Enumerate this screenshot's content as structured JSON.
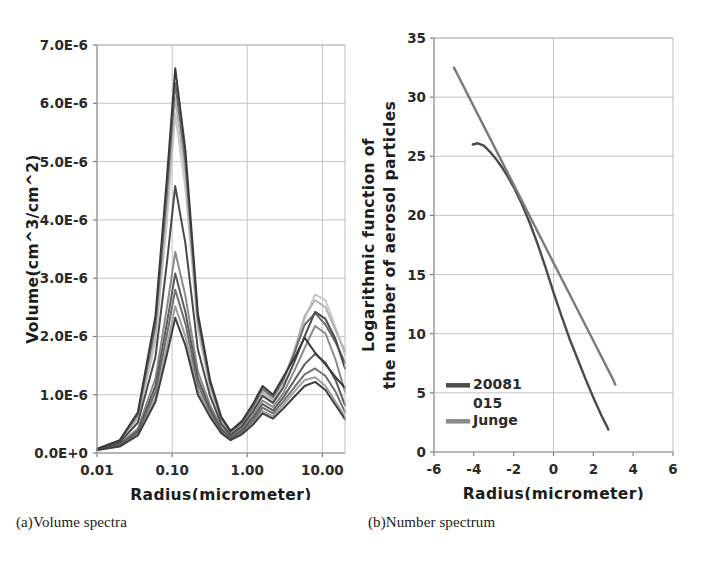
{
  "figure": {
    "caption_a": "(a)Volume spectra",
    "caption_b": "(b)Number spectrum"
  },
  "chart_data": [
    {
      "panel": "a",
      "type": "line",
      "title": "",
      "xlabel": "Radius(micrometer)",
      "ylabel": "Volume(cm^3/cm^2)",
      "xscale": "log",
      "xlim": [
        0.01,
        20
      ],
      "ylim": [
        0.0,
        7e-06
      ],
      "grid": true,
      "legend_position": "none",
      "xticks": [
        0.01,
        0.1,
        1.0,
        10.0
      ],
      "xticklabels": [
        "0.01",
        "0.10",
        "1.00",
        "10.00"
      ],
      "yticks": [
        0.0,
        1e-06,
        2e-06,
        3e-06,
        4e-06,
        5e-06,
        6e-06,
        7e-06
      ],
      "yticklabels": [
        "0.0E+0",
        "1.0E-6",
        "2.0E-6",
        "3.0E-6",
        "4.0E-6",
        "5.0E-6",
        "6.0E-6",
        "7.0E-6"
      ],
      "x": [
        0.01,
        0.02,
        0.035,
        0.06,
        0.085,
        0.11,
        0.15,
        0.22,
        0.32,
        0.45,
        0.6,
        0.85,
        1.2,
        1.6,
        2.2,
        3.0,
        4.2,
        5.8,
        8.0,
        11.0,
        15.0,
        20.0
      ],
      "series": [
        {
          "name": "curve-1",
          "color": "#3a3a3a",
          "values": [
            7e-08,
            2.2e-07,
            7e-07,
            2.35e-06,
            4.7e-06,
            6.6e-06,
            5.2e-06,
            2.4e-06,
            1.25e-06,
            6.2e-07,
            3.8e-07,
            5.5e-07,
            8.5e-07,
            1.15e-06,
            1e-06,
            1.3e-06,
            1.62e-06,
            1.98e-06,
            1.72e-06,
            1.52e-06,
            1.3e-06,
            1.12e-06
          ]
        },
        {
          "name": "curve-2",
          "color": "#6a6a6a",
          "values": [
            7e-08,
            2.1e-07,
            6.6e-07,
            2.2e-06,
            4.45e-06,
            6.35e-06,
            5e-06,
            2.3e-06,
            1.2e-06,
            6e-07,
            3.6e-07,
            5.2e-07,
            8e-07,
            1.1e-06,
            9.6e-07,
            1.25e-06,
            1.7e-06,
            2.2e-06,
            2.4e-06,
            2.2e-06,
            1.9e-06,
            1.55e-06
          ]
        },
        {
          "name": "curve-3",
          "color": "#b4b4b4",
          "values": [
            7e-08,
            2e-07,
            6.2e-07,
            2.05e-06,
            4.2e-06,
            6.1e-06,
            4.8e-06,
            2.22e-06,
            1.16e-06,
            5.7e-07,
            3.4e-07,
            5e-07,
            7.8e-07,
            1.05e-06,
            9.2e-07,
            1.22e-06,
            1.75e-06,
            2.35e-06,
            2.62e-06,
            2.5e-06,
            2.1e-06,
            1.75e-06
          ]
        },
        {
          "name": "curve-4",
          "color": "#4a4a4a",
          "values": [
            6e-08,
            1.8e-07,
            5.2e-07,
            1.65e-06,
            3.25e-06,
            4.58e-06,
            3.6e-06,
            1.78e-06,
            9.8e-07,
            5e-07,
            3.1e-07,
            4.6e-07,
            7.2e-07,
            9.8e-07,
            8.6e-07,
            1.12e-06,
            1.55e-06,
            2e-06,
            2.42e-06,
            2.3e-06,
            1.95e-06,
            1.45e-06
          ]
        },
        {
          "name": "curve-5",
          "color": "#8a8a8a",
          "values": [
            6e-08,
            1.5e-07,
            4.2e-07,
            1.28e-06,
            2.48e-06,
            3.45e-06,
            2.7e-06,
            1.4e-06,
            8.2e-07,
            4.4e-07,
            2.8e-07,
            4.2e-07,
            6.6e-07,
            9e-07,
            7.9e-07,
            1.02e-06,
            1.4e-06,
            1.8e-06,
            2.18e-06,
            2.05e-06,
            1.6e-06,
            1.05e-06
          ]
        },
        {
          "name": "curve-6",
          "color": "#5c5c5c",
          "values": [
            6e-08,
            1.4e-07,
            3.8e-07,
            1.15e-06,
            2.22e-06,
            3.08e-06,
            2.42e-06,
            1.28e-06,
            7.6e-07,
            4.1e-07,
            2.6e-07,
            3.9e-07,
            6.1e-07,
            8.4e-07,
            7.3e-07,
            9.5e-07,
            1.24e-06,
            1.52e-06,
            1.7e-06,
            1.55e-06,
            1.25e-06,
            8.2e-07
          ]
        },
        {
          "name": "curve-7",
          "color": "#707070",
          "values": [
            5e-08,
            1.3e-07,
            3.5e-07,
            1.05e-06,
            2.02e-06,
            2.8e-06,
            2.22e-06,
            1.18e-06,
            7.1e-07,
            3.8e-07,
            2.5e-07,
            3.6e-07,
            5.6e-07,
            7.8e-07,
            6.8e-07,
            8.8e-07,
            1.12e-06,
            1.35e-06,
            1.45e-06,
            1.32e-06,
            1.05e-06,
            7e-07
          ]
        },
        {
          "name": "curve-8",
          "color": "#a0a0a0",
          "values": [
            5e-08,
            1.2e-07,
            3.2e-07,
            9.5e-07,
            1.82e-06,
            2.52e-06,
            2e-06,
            1.08e-06,
            6.6e-07,
            3.6e-07,
            2.3e-07,
            3.4e-07,
            5.2e-07,
            7.2e-07,
            6.3e-07,
            8.2e-07,
            1.05e-06,
            1.25e-06,
            1.3e-06,
            1.15e-06,
            8.8e-07,
            6.2e-07
          ]
        },
        {
          "name": "curve-9",
          "color": "#3f3f3f",
          "values": [
            5e-08,
            1.1e-07,
            3e-07,
            8.8e-07,
            1.68e-06,
            2.32e-06,
            1.85e-06,
            1e-06,
            6.2e-07,
            3.4e-07,
            2.2e-07,
            3.2e-07,
            4.9e-07,
            6.8e-07,
            5.9e-07,
            7.6e-07,
            9.6e-07,
            1.15e-06,
            1.22e-06,
            1.08e-06,
            8.2e-07,
            5.8e-07
          ]
        },
        {
          "name": "curve-10",
          "color": "#c8c8c8",
          "values": [
            5e-08,
            1.9e-07,
            5.8e-07,
            1.92e-06,
            3.95e-06,
            5.82e-06,
            4.55e-06,
            2.12e-06,
            1.1e-06,
            5.4e-07,
            3.3e-07,
            4.8e-07,
            7.6e-07,
            1.02e-06,
            9e-07,
            1.2e-06,
            1.72e-06,
            2.3e-06,
            2.72e-06,
            2.62e-06,
            2.15e-06,
            1.68e-06
          ]
        }
      ]
    },
    {
      "panel": "b",
      "type": "line",
      "title": "",
      "xlabel": "Radius(micrometer)",
      "ylabel_line1": "Logarithmic function of",
      "ylabel_line2": "the number of aerosol particles",
      "xscale": "linear",
      "xlim": [
        -6,
        6
      ],
      "ylim": [
        0,
        35
      ],
      "grid": true,
      "legend_position": "inside-lower-left",
      "xticks": [
        -6,
        -4,
        -2,
        0,
        2,
        4,
        6
      ],
      "xticklabels": [
        "-6",
        "-4",
        "-2",
        "0",
        "2",
        "4",
        "6"
      ],
      "yticks": [
        0,
        5,
        10,
        15,
        20,
        25,
        30,
        35
      ],
      "yticklabels": [
        "0",
        "5",
        "10",
        "15",
        "20",
        "25",
        "30",
        "35"
      ],
      "legend": [
        {
          "label_line1": "20081",
          "label_line2": "015",
          "color": "#4a4a4a",
          "name": "series-20081015"
        },
        {
          "label_line1": "Junge",
          "label_line2": "",
          "color": "#8a8a8a",
          "name": "series-junge"
        }
      ],
      "series": [
        {
          "name": "20081015",
          "color": "#4a4a4a",
          "x": [
            -4.05,
            -3.8,
            -3.5,
            -3.2,
            -2.9,
            -2.6,
            -2.3,
            -2.0,
            -1.6,
            -1.2,
            -0.8,
            -0.4,
            0.0,
            0.4,
            0.8,
            1.2,
            1.6,
            2.0,
            2.4,
            2.7,
            2.75
          ],
          "y": [
            26.0,
            26.1,
            25.9,
            25.4,
            24.8,
            24.1,
            23.3,
            22.4,
            21.0,
            19.4,
            17.6,
            15.6,
            13.5,
            11.5,
            9.6,
            7.9,
            6.2,
            4.6,
            3.1,
            2.1,
            1.9
          ]
        },
        {
          "name": "Junge",
          "color": "#7a7a7a",
          "x": [
            -5.0,
            -4.0,
            -3.0,
            -2.0,
            -1.0,
            0.0,
            1.0,
            2.0,
            3.0,
            3.1
          ],
          "y": [
            32.5,
            29.2,
            25.9,
            22.6,
            19.3,
            16.0,
            12.7,
            9.4,
            6.1,
            5.7
          ]
        }
      ]
    }
  ]
}
